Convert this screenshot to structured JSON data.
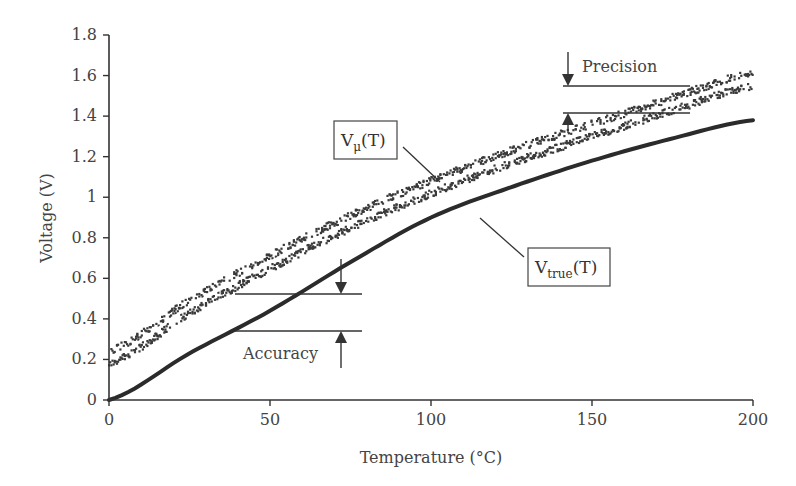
{
  "chart_data": {
    "type": "line",
    "title": "",
    "xlabel": "Temperature (°C)",
    "ylabel": "Voltage (V)",
    "xlim": [
      0,
      200
    ],
    "ylim": [
      0,
      1.8
    ],
    "x_ticks": [
      "0",
      "50",
      "100",
      "150",
      "200"
    ],
    "y_ticks": [
      "0",
      "0.2",
      "0.4",
      "0.6",
      "0.8",
      "1",
      "1.2",
      "1.4",
      "1.6",
      "1.8"
    ],
    "grid": false,
    "x": [
      0,
      25,
      50,
      75,
      100,
      125,
      150,
      175,
      200
    ],
    "series": [
      {
        "name": "V_true(T)",
        "style": "thick dark solid line",
        "values": [
          0.0,
          0.23,
          0.44,
          0.68,
          0.9,
          1.05,
          1.18,
          1.29,
          1.38
        ]
      },
      {
        "name": "V_μ(T)",
        "style": "white center line inside scattered measurement band",
        "values": [
          0.21,
          0.46,
          0.68,
          0.88,
          1.05,
          1.2,
          1.33,
          1.46,
          1.58
        ],
        "band_halfwidth": 0.05
      }
    ],
    "annotations": [
      {
        "text": "Precision",
        "type": "bracket-arrows",
        "at_x_range": [
          140,
          180
        ],
        "y_top": 1.55,
        "y_bottom": 1.41
      },
      {
        "text": "Accuracy",
        "type": "bracket-arrows",
        "at_x_range": [
          40,
          78
        ],
        "y_top": 0.52,
        "y_bottom": 0.34
      },
      {
        "text": "V_μ(T)",
        "type": "boxed-label",
        "base": "V",
        "subscript": "μ",
        "suffix": "(T)"
      },
      {
        "text": "V_true(T)",
        "type": "boxed-label",
        "base": "V",
        "subscript": "true",
        "suffix": "(T)"
      }
    ],
    "legend_position": "none"
  },
  "labels": {
    "xlabel": "Temperature (°C)",
    "ylabel": "Voltage (V)",
    "precision": "Precision",
    "accuracy": "Accuracy",
    "vmu": {
      "base": "V",
      "sub": "μ",
      "suffix": "(T)"
    },
    "vtrue": {
      "base": "V",
      "sub": "true",
      "suffix": "(T)"
    }
  },
  "colors": {
    "true_line": "#2b2b2b",
    "band": "#3a3a3a",
    "center_line": "#ffffff",
    "axis": "#333333",
    "text": "#444444"
  }
}
